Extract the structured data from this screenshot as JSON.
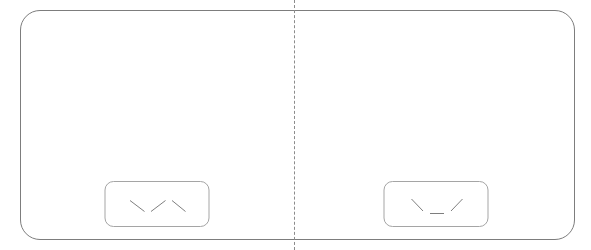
{
  "figure": {
    "background_color": "#ffffff",
    "panel_border_color": "#7d7d7d",
    "divider": {
      "style": "dashed",
      "color": "#8c8c8c",
      "orientation": "vertical"
    },
    "atom_colors": {
      "carbon": "#000000",
      "hydrogen": "#ffffff",
      "bond": "#bdbdbd"
    }
  },
  "panels": [
    {
      "id": "left",
      "name": "anti-conformation",
      "molecule": {
        "name": "butane",
        "shape": "extended zigzag",
        "carbon_count": 4,
        "hydrogen_count": 10
      },
      "formula": {
        "labels": [
          "C",
          "C",
          "C",
          "C"
        ],
        "bond_labels": [
          "",
          "",
          ""
        ],
        "description": "four carbon zigzag chain"
      }
    },
    {
      "id": "right",
      "name": "gauche-conformation",
      "molecule": {
        "name": "butane",
        "shape": "valley / U shape",
        "carbon_count": 4,
        "hydrogen_count": 10
      },
      "formula": {
        "labels": [
          "C",
          "C",
          "C",
          "C"
        ],
        "bond_labels": [
          "",
          "—",
          ""
        ],
        "description": "four carbon chain with horizontal central bond"
      }
    }
  ]
}
